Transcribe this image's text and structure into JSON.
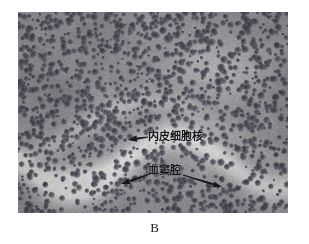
{
  "figure": {
    "panel_label": "B",
    "modality": "light-microscopy-histology",
    "stain_description": "hematoxylin-eosin-grayscale",
    "plate": {
      "left": 18,
      "top": 12,
      "width": 270,
      "height": 201
    }
  },
  "annotations": [
    {
      "id": "endothelial-nucleus",
      "text": "内皮细胞核",
      "text_x": 148,
      "text_y": 131,
      "arrows": [
        {
          "x1": 148,
          "y1": 137,
          "x2": 128,
          "y2": 140
        }
      ]
    },
    {
      "id": "sinusoid-cavity",
      "text": "血窦腔",
      "text_x": 148,
      "text_y": 165,
      "arrows": [
        {
          "x1": 150,
          "y1": 174,
          "x2": 121,
          "y2": 184
        },
        {
          "x1": 183,
          "y1": 175,
          "x2": 222,
          "y2": 187
        }
      ]
    }
  ],
  "colors": {
    "page_background": "#ffffff",
    "tissue_mid": "#8e8b90",
    "tissue_dark_nucleus": "#4a4750",
    "tissue_light_sinusoid": "#e8e6e4",
    "annotation_ink": "#17161a",
    "caption_ink": "#1a1a1a"
  },
  "texture_seed": 20240517
}
